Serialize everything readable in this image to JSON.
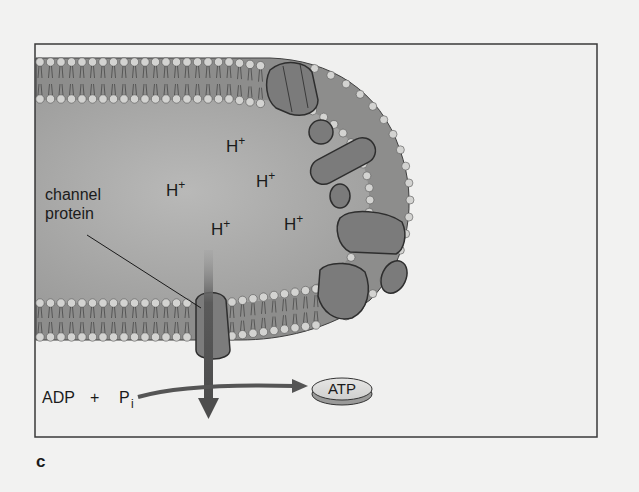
{
  "figure": {
    "panel_label": "c",
    "colors": {
      "page_bg": "#f2f2f1",
      "frame_stroke": "#3a3a3a",
      "interior_fill": "#a9a9a9",
      "membrane_fill": "#8e8e8e",
      "head_fill": "#d2d2d0",
      "protein_fill": "#7d7d7d",
      "arrow_fill": "#555555",
      "text": "#1b1b1b"
    },
    "labels": {
      "channel_protein_line1": "channel",
      "channel_protein_line2": "protein",
      "reactant_adp": "ADP",
      "reactant_plus": "+",
      "reactant_p": "P",
      "reactant_sub": "i",
      "product": "ATP"
    },
    "ions": [
      {
        "symbol": "H",
        "charge": "+"
      },
      {
        "symbol": "H",
        "charge": "+"
      },
      {
        "symbol": "H",
        "charge": "+"
      },
      {
        "symbol": "H",
        "charge": "+"
      },
      {
        "symbol": "H",
        "charge": "+"
      }
    ]
  }
}
